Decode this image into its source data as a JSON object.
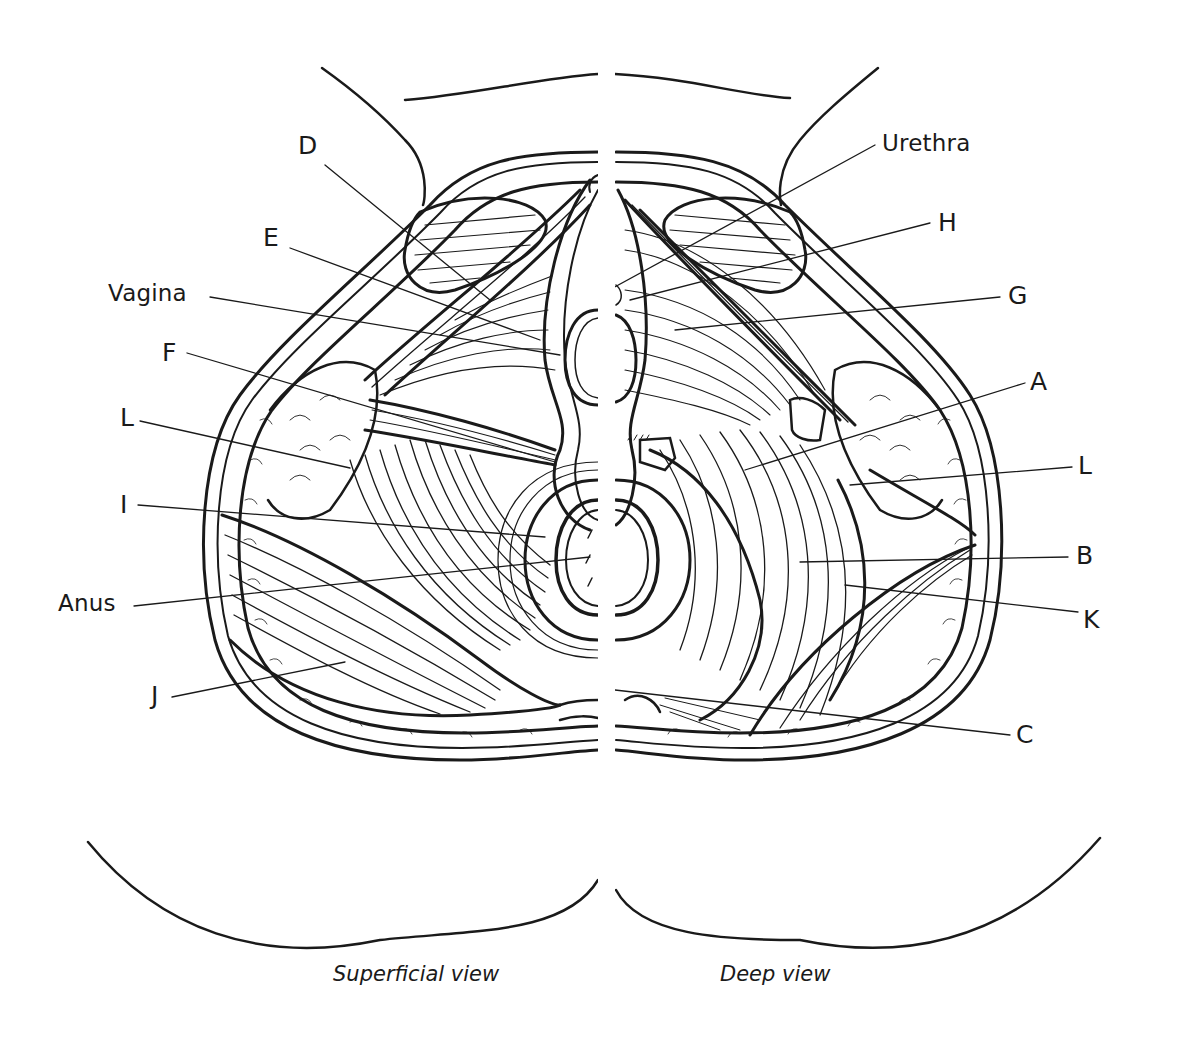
{
  "figure": {
    "captions": {
      "left": "Superficial view",
      "right": "Deep view"
    },
    "colors": {
      "ink": "#1a1a1a",
      "background": "#ffffff"
    },
    "labels_left": [
      {
        "id": "D",
        "text": "D"
      },
      {
        "id": "E",
        "text": "E"
      },
      {
        "id": "vagina",
        "text": "Vagina"
      },
      {
        "id": "F",
        "text": "F"
      },
      {
        "id": "L_left",
        "text": "L"
      },
      {
        "id": "I",
        "text": "I"
      },
      {
        "id": "anus",
        "text": "Anus"
      },
      {
        "id": "J",
        "text": "J"
      }
    ],
    "labels_right": [
      {
        "id": "urethra",
        "text": "Urethra"
      },
      {
        "id": "H",
        "text": "H"
      },
      {
        "id": "G",
        "text": "G"
      },
      {
        "id": "A",
        "text": "A"
      },
      {
        "id": "L_right",
        "text": "L"
      },
      {
        "id": "B",
        "text": "B"
      },
      {
        "id": "K",
        "text": "K"
      },
      {
        "id": "C",
        "text": "C"
      }
    ]
  }
}
